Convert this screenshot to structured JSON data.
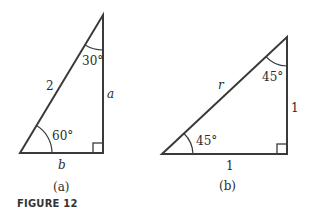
{
  "figure": {
    "caption": "FIGURE 12",
    "panels": [
      {
        "id": "a",
        "label": "(a)",
        "hypotenuse": "2",
        "vertical_side": "a",
        "base": "b",
        "top_angle": "30°",
        "bottom_angle": "60°"
      },
      {
        "id": "b",
        "label": "(b)",
        "hypotenuse": "r",
        "vertical_side": "1",
        "base": "1",
        "top_angle": "45°",
        "bottom_angle": "45°"
      }
    ]
  },
  "colors": {
    "line": "#3a3a3a",
    "text": "#2b2b2b"
  }
}
